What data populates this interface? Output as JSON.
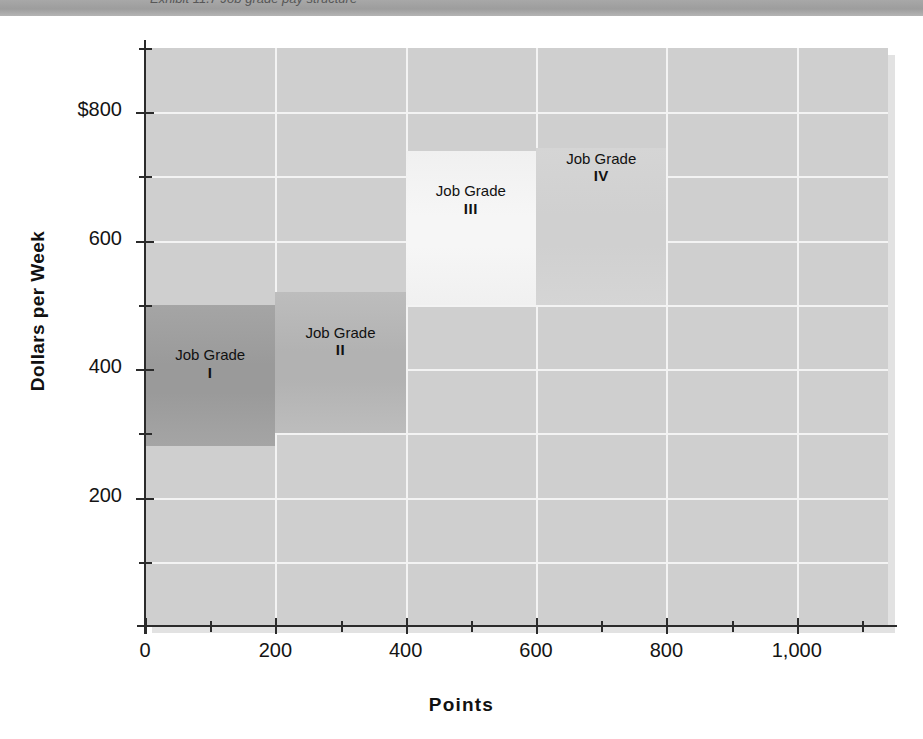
{
  "page": {
    "top_band_text": "Exhibit 11.7  Job grade pay structure"
  },
  "chart_data": {
    "type": "bar",
    "title": "",
    "subtitle": "",
    "xlabel": "Points",
    "ylabel": "Dollars per Week",
    "xlim": [
      0,
      1140
    ],
    "ylim": [
      0,
      900
    ],
    "grid": true,
    "legend_position": "none",
    "x_ticks": [
      {
        "value": 0,
        "label": "0",
        "major": true
      },
      {
        "value": 100,
        "label": "",
        "major": false
      },
      {
        "value": 200,
        "label": "200",
        "major": true
      },
      {
        "value": 300,
        "label": "",
        "major": false
      },
      {
        "value": 400,
        "label": "400",
        "major": true
      },
      {
        "value": 500,
        "label": "",
        "major": false
      },
      {
        "value": 600,
        "label": "600",
        "major": true
      },
      {
        "value": 700,
        "label": "",
        "major": false
      },
      {
        "value": 800,
        "label": "800",
        "major": true
      },
      {
        "value": 900,
        "label": "",
        "major": false
      },
      {
        "value": 1000,
        "label": "1,000",
        "major": true
      },
      {
        "value": 1100,
        "label": "",
        "major": false
      }
    ],
    "y_ticks": [
      {
        "value": 100,
        "label": "",
        "major": false
      },
      {
        "value": 200,
        "label": "200",
        "major": true
      },
      {
        "value": 300,
        "label": "",
        "major": false
      },
      {
        "value": 400,
        "label": "400",
        "major": true
      },
      {
        "value": 500,
        "label": "",
        "major": false
      },
      {
        "value": 600,
        "label": "600",
        "major": true
      },
      {
        "value": 700,
        "label": "",
        "major": false
      },
      {
        "value": 800,
        "label": "$800",
        "major": true
      },
      {
        "value": 900,
        "label": "",
        "major": false
      }
    ],
    "x_gridlines": [
      200,
      400,
      600,
      800,
      1000
    ],
    "y_gridlines": [
      100,
      200,
      300,
      400,
      500,
      600,
      700,
      800
    ],
    "blocks": [
      {
        "name": "Job Grade",
        "roman": "I",
        "x_start": 0,
        "x_end": 200,
        "y_start": 280,
        "y_end": 500,
        "color": "#a5a5a5",
        "color_mid": "#9a9a9a",
        "label_y": 420
      },
      {
        "name": "Job Grade",
        "roman": "II",
        "x_start": 200,
        "x_end": 400,
        "y_start": 300,
        "y_end": 520,
        "color": "#bdbdbd",
        "color_mid": "#b2b2b2",
        "label_y": 455
      },
      {
        "name": "Job Grade",
        "roman": "III",
        "x_start": 400,
        "x_end": 600,
        "y_start": 500,
        "y_end": 740,
        "color": "#f0f0f0",
        "color_mid": "#f6f6f6",
        "label_y": 675
      },
      {
        "name": "Job Grade",
        "roman": "IV",
        "x_start": 600,
        "x_end": 800,
        "y_start": 500,
        "y_end": 745,
        "color": "#d5d5d5",
        "color_mid": "#d0d0d0",
        "label_y": 790
      }
    ],
    "plot_background": "#cfcfcf",
    "gridline_color": "#f3f3f3",
    "axis_color": "#2b2b2b"
  }
}
